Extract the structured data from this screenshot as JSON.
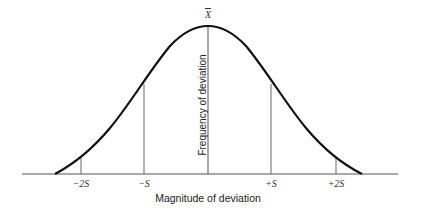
{
  "diagram": {
    "type": "normal-distribution-curve",
    "x_axis_label": "Magnitude of deviation",
    "y_axis_label": "Frequency of deviation",
    "mean_label": "X",
    "tick_labels": [
      "−2S",
      "−S",
      "+S",
      "+2S"
    ],
    "tick_positions_sd": [
      -2,
      -1,
      1,
      2
    ],
    "colors": {
      "curve": "#111111",
      "lines": "#555555",
      "text": "#222222"
    }
  }
}
